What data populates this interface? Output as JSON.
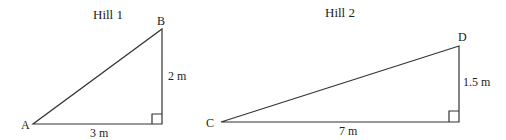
{
  "hill1": {
    "title": "Hill 1",
    "vertex_a": "A",
    "vertex_b": "B",
    "height_label": "2 m",
    "base_label": "3 m"
  },
  "hill2": {
    "title": "Hill 2",
    "vertex_c": "C",
    "vertex_d": "D",
    "height_label": "1.5 m",
    "base_label": "7 m"
  },
  "colors": {
    "line": "#333333",
    "text": "#222222"
  }
}
